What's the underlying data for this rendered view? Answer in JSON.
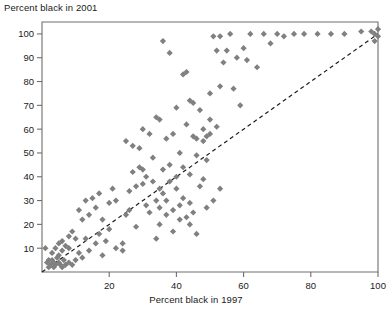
{
  "chart_data": {
    "type": "scatter",
    "title": "",
    "ylabel": "Percent black in 2001",
    "xlabel": "Percent black in 1997",
    "xlim": [
      0,
      100
    ],
    "ylim": [
      0,
      105
    ],
    "xticks": [
      20,
      40,
      60,
      80,
      100
    ],
    "yticks": [
      10,
      20,
      30,
      40,
      50,
      60,
      70,
      80,
      90,
      100
    ],
    "grid": false,
    "legend": null,
    "marker": "diamond",
    "marker_color": "#808080",
    "reference_line": {
      "type": "identity",
      "style": "dashed",
      "color": "#1c1c1c",
      "from": [
        0,
        0
      ],
      "to": [
        100,
        100
      ]
    },
    "points": [
      [
        1,
        10
      ],
      [
        1.5,
        4
      ],
      [
        2,
        2
      ],
      [
        2.5,
        3
      ],
      [
        3,
        5
      ],
      [
        3.5,
        2
      ],
      [
        4,
        3
      ],
      [
        4.5,
        6
      ],
      [
        5,
        4
      ],
      [
        5.5,
        3
      ],
      [
        6,
        2
      ],
      [
        6.5,
        5
      ],
      [
        3,
        8
      ],
      [
        4,
        10
      ],
      [
        5,
        12
      ],
      [
        7,
        3
      ],
      [
        8,
        4
      ],
      [
        9,
        3
      ],
      [
        2,
        5
      ],
      [
        3.5,
        4
      ],
      [
        6,
        9
      ],
      [
        7,
        11
      ],
      [
        8,
        10
      ],
      [
        5,
        7
      ],
      [
        9,
        17
      ],
      [
        10,
        5
      ],
      [
        11,
        8
      ],
      [
        12,
        6
      ],
      [
        13,
        14
      ],
      [
        14,
        9
      ],
      [
        11,
        26
      ],
      [
        13,
        30
      ],
      [
        15,
        31
      ],
      [
        16,
        27
      ],
      [
        17,
        33
      ],
      [
        18,
        22
      ],
      [
        19,
        13
      ],
      [
        20,
        29
      ],
      [
        21,
        35
      ],
      [
        22,
        30
      ],
      [
        24,
        12
      ],
      [
        25,
        24
      ],
      [
        26,
        34
      ],
      [
        27,
        42
      ],
      [
        28,
        19
      ],
      [
        29,
        44
      ],
      [
        30,
        43
      ],
      [
        31,
        28
      ],
      [
        32,
        25
      ],
      [
        33,
        48
      ],
      [
        34,
        14
      ],
      [
        35,
        20
      ],
      [
        36,
        33
      ],
      [
        37,
        56
      ],
      [
        38,
        45
      ],
      [
        39,
        58
      ],
      [
        40,
        35
      ],
      [
        41,
        50
      ],
      [
        42,
        31
      ],
      [
        43,
        62
      ],
      [
        44,
        29
      ],
      [
        45,
        57
      ],
      [
        46,
        56
      ],
      [
        47,
        68
      ],
      [
        48,
        55
      ],
      [
        49,
        57
      ],
      [
        50,
        75
      ],
      [
        51,
        99
      ],
      [
        52,
        93
      ],
      [
        53,
        78
      ],
      [
        36,
        97
      ],
      [
        38,
        92
      ],
      [
        40,
        69
      ],
      [
        42,
        83
      ],
      [
        43,
        84
      ],
      [
        44,
        72
      ],
      [
        45,
        71
      ],
      [
        34,
        65
      ],
      [
        35,
        64
      ],
      [
        30,
        60
      ],
      [
        32,
        58
      ],
      [
        29,
        52
      ],
      [
        27,
        53
      ],
      [
        25,
        55
      ],
      [
        33,
        38
      ],
      [
        35,
        27
      ],
      [
        37,
        24
      ],
      [
        39,
        17
      ],
      [
        41,
        22
      ],
      [
        44,
        20
      ],
      [
        46,
        16
      ],
      [
        47,
        36
      ],
      [
        48,
        39
      ],
      [
        49,
        47
      ],
      [
        50,
        64
      ],
      [
        54,
        88
      ],
      [
        56,
        100
      ],
      [
        58,
        90
      ],
      [
        60,
        94
      ],
      [
        62,
        100
      ],
      [
        64,
        86
      ],
      [
        66,
        100
      ],
      [
        68,
        96
      ],
      [
        70,
        100
      ],
      [
        72,
        99
      ],
      [
        75,
        100
      ],
      [
        78,
        100
      ],
      [
        82,
        100
      ],
      [
        86,
        100
      ],
      [
        90,
        100
      ],
      [
        95,
        101
      ],
      [
        98,
        101
      ],
      [
        99,
        100
      ],
      [
        99,
        97
      ],
      [
        100,
        102
      ],
      [
        100,
        99
      ],
      [
        57,
        77
      ],
      [
        53,
        99
      ],
      [
        55,
        93
      ],
      [
        59,
        70
      ],
      [
        61,
        89
      ],
      [
        22,
        10
      ],
      [
        24,
        9
      ],
      [
        18,
        7
      ],
      [
        16,
        12
      ],
      [
        44,
        41
      ],
      [
        46,
        49
      ],
      [
        42,
        44
      ],
      [
        40,
        40
      ],
      [
        48,
        60
      ],
      [
        38,
        38
      ],
      [
        36,
        43
      ],
      [
        34,
        30
      ],
      [
        50,
        58
      ],
      [
        52,
        61
      ],
      [
        26,
        26
      ],
      [
        28,
        36
      ],
      [
        30,
        37
      ],
      [
        20,
        18
      ],
      [
        17,
        16
      ],
      [
        14,
        24
      ],
      [
        12,
        22
      ],
      [
        10,
        14
      ],
      [
        8,
        15
      ],
      [
        6,
        13
      ],
      [
        49,
        27
      ],
      [
        51,
        30
      ],
      [
        53,
        35
      ],
      [
        45,
        25
      ],
      [
        43,
        23
      ],
      [
        41,
        28
      ],
      [
        39,
        26
      ],
      [
        37,
        30
      ],
      [
        35,
        35
      ],
      [
        31,
        40
      ]
    ]
  }
}
